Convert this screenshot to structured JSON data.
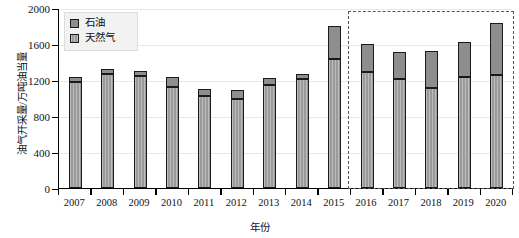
{
  "chart_data": {
    "type": "bar",
    "stacked": true,
    "title": "",
    "xlabel": "年份",
    "ylabel": "油气开采量/万吨油当量",
    "categories": [
      "2007",
      "2008",
      "2009",
      "2010",
      "2011",
      "2012",
      "2013",
      "2014",
      "2015",
      "2016",
      "2017",
      "2018",
      "2019",
      "2020"
    ],
    "series": [
      {
        "name": "天然气",
        "values": [
          1175,
          1265,
          1245,
          1120,
          1020,
          990,
          1145,
          1210,
          1430,
          1290,
          1210,
          1110,
          1230,
          1255
        ]
      },
      {
        "name": "石油",
        "values": [
          55,
          55,
          55,
          110,
          80,
          100,
          75,
          60,
          370,
          310,
          300,
          410,
          390,
          575
        ]
      }
    ],
    "totals": [
      1230,
      1320,
      1300,
      1230,
      1100,
      1090,
      1220,
      1270,
      1800,
      1600,
      1510,
      1520,
      1620,
      1830
    ],
    "ylim": [
      0,
      2000
    ],
    "yticks": [
      0,
      400,
      800,
      1200,
      1600,
      2000
    ],
    "ytick_labels": [
      "0",
      "400",
      "800",
      "1200",
      "1600",
      "2000"
    ],
    "grid": true,
    "grid_axis": "y",
    "legend_position": "top-left",
    "legend_entries": [
      "石油",
      "天然气"
    ],
    "annotations": [
      {
        "type": "dashed-rectangle",
        "label": "",
        "covers_categories": [
          "2016",
          "2017",
          "2018",
          "2019",
          "2020"
        ]
      }
    ],
    "colors": {
      "oil": "#8e8e8e",
      "gas": "#9a9a9a",
      "bar_edge": "#1a1a1a",
      "grid": "#e8e8e8",
      "axis": "#000000",
      "highlight_box": "#555555",
      "legend_bg": "#f2f2f2"
    }
  }
}
